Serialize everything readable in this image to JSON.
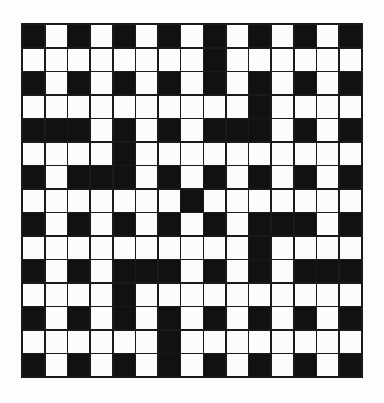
{
  "puzzle": {
    "type": "crossword",
    "rows": 15,
    "cols": 15,
    "colors": {
      "block": "#111111",
      "open": "#fcfcfc",
      "line": "#1a1a1a"
    },
    "grid": [
      "#.#.#.#.#.#.#.#",
      "........#......",
      "#.#.#.#.#.#.#.#",
      "..........#....",
      "###.#.#.###.#.#",
      "....#..........",
      "#.###.#.#.#.#.#",
      ".......#.......",
      "#.#.#.#.#.###.#",
      "..........#....",
      "#.#.###.#.#.###",
      "....#..........",
      "#.#.#.#.#.#.#.#",
      "......#........",
      "#.#.#.#.#.#.#.#"
    ]
  }
}
